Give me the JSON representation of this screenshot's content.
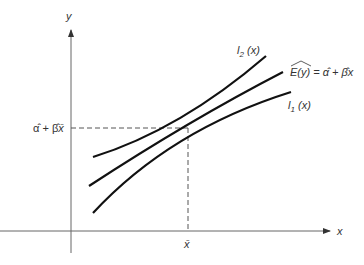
{
  "diagram": {
    "type": "regression-confidence-band",
    "axes": {
      "x_label": "x",
      "y_label": "y"
    },
    "curves": [
      {
        "id": "l2",
        "label_main": "l",
        "label_sub": "2",
        "label_arg": " (x)",
        "description": "upper band"
      },
      {
        "id": "fit",
        "label": "E(y) = α̂ + β̂x",
        "description": "fitted regression line"
      },
      {
        "id": "l1",
        "label_main": "l",
        "label_sub": "1",
        "label_arg": " (x)",
        "description": "lower band"
      }
    ],
    "fit_label": {
      "lhs": "E(y)",
      "eq": " = ",
      "alpha": "α̂",
      "plus": " + ",
      "beta": "β̂",
      "x": "x"
    },
    "reference": {
      "x_tick_label": "x̄",
      "y_tick_label_alpha": "α̂",
      "y_tick_label_plus": " + ",
      "y_tick_label_beta": "β̂",
      "y_tick_label_xbar": "x̄"
    }
  }
}
